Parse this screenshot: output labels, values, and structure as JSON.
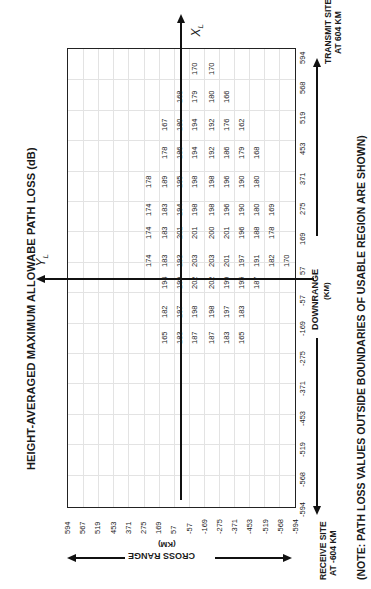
{
  "chart_data": {
    "type": "table",
    "title": "HEIGHT-AVERAGED MAXIMUM ALLOWABE PATH LOSS (dB)",
    "note": "(NOTE:  PATH LOSS VALUES OUTSIDE BOUNDARIES OF USABLE REGION  ARE SHOWN)",
    "xlabel": "DOWNRANGE (KM)",
    "ylabel": "CROSS RANGE (KM)",
    "x_axis_name": "X_L",
    "y_axis_name": "Y_L",
    "receive_site": "RECEIVE SITE AT -604 KM",
    "transmit_site": "TRANSMIT SITE AT 604 KM",
    "downrange_ticks": [
      -594,
      -568,
      -519,
      -453,
      -371,
      -275,
      -169,
      -57,
      57,
      169,
      275,
      371,
      453,
      519,
      568,
      594
    ],
    "crossrange_ticks": [
      594,
      567,
      519,
      453,
      371,
      275,
      169,
      57,
      -57,
      -169,
      -275,
      -371,
      -453,
      -519,
      -568,
      -594
    ],
    "grid": true,
    "columns_note": "columns ordered left-to-right on the page (cross range decreasing)",
    "rows": [
      {
        "downrange_label": "568",
        "values": [
          null,
          null,
          null,
          null,
          "170",
          "170"
        ]
      },
      {
        "downrange_label": "519",
        "values": [
          null,
          null,
          null,
          "168",
          "179",
          "180",
          "166"
        ]
      },
      {
        "downrange_label": "453",
        "values": [
          null,
          null,
          "167",
          "180",
          "194",
          "192",
          "176",
          "162"
        ]
      },
      {
        "downrange_label": "371",
        "values": [
          null,
          "178",
          "186",
          "194",
          "192",
          "186",
          "179",
          "168"
        ]
      },
      {
        "downrange_label": "275",
        "values": [
          "178",
          "189",
          "195",
          "198",
          "198",
          "196",
          "190",
          "180",
          "169"
        ]
      },
      {
        "downrange_label": "169",
        "values": [
          "174",
          "183",
          "194",
          "198",
          "201",
          "200",
          "201",
          "196",
          "188",
          "178"
        ]
      },
      {
        "downrange_label": "57",
        "values": [
          "174",
          "183",
          "193",
          "201",
          "203",
          "203",
          "201",
          "197",
          "191",
          "182",
          "170"
        ]
      },
      {
        "downrange_label": "-57",
        "values": [
          "174",
          "194",
          "199",
          "202",
          "202",
          "199",
          "195",
          "187"
        ]
      },
      {
        "downrange_label": "-169",
        "values": [
          "182",
          "197",
          "198",
          "198",
          "197",
          "183"
        ]
      },
      {
        "downrange_label": "-275",
        "values": [
          "165",
          "183",
          "187",
          "187",
          "183",
          "165"
        ]
      }
    ]
  },
  "labels": {
    "title": "HEIGHT-AVERAGED MAXIMUM ALLOWABE PATH LOSS (dB)",
    "note": "(NOTE:  PATH LOSS VALUES OUTSIDE BOUNDARIES OF USABLE REGION  ARE SHOWN)",
    "downrange": "DOWNRANGE",
    "downrange_unit": "(KM)",
    "crossrange": "CROSS RANGE",
    "crossrange_unit": "(KM)",
    "x_axis": "X",
    "x_axis_sub": "L",
    "y_axis": "Y",
    "y_axis_sub": "L",
    "receive_line1": "RECEIVE SITE",
    "receive_line2": "AT -604 KM",
    "transmit_line1": "TRANSMIT SITE",
    "transmit_line2": "AT 604 KM"
  },
  "ticks": {
    "down": [
      "594",
      "568",
      "519",
      "453",
      "371",
      "275",
      "169",
      "57",
      "-57",
      "-169",
      "-275",
      "-371",
      "-453",
      "-519",
      "-568",
      "-594"
    ],
    "cross": [
      "594",
      "567",
      "519",
      "453",
      "371",
      "275",
      "169",
      "57",
      "-57",
      "-169",
      "-275",
      "-371",
      "-453",
      "-519",
      "-568",
      "-594"
    ]
  },
  "cells": [
    {
      "x": 144,
      "y": 267,
      "v": "174"
    },
    {
      "x": 144,
      "y": 239,
      "v": "174"
    },
    {
      "x": 144,
      "y": 216,
      "v": "174"
    },
    {
      "x": 144,
      "y": 188,
      "v": "178"
    },
    {
      "x": 160,
      "y": 344,
      "v": "165"
    },
    {
      "x": 160,
      "y": 318,
      "v": "182"
    },
    {
      "x": 160,
      "y": 289,
      "v": "194"
    },
    {
      "x": 160,
      "y": 267,
      "v": "183"
    },
    {
      "x": 160,
      "y": 239,
      "v": "183"
    },
    {
      "x": 160,
      "y": 216,
      "v": "183"
    },
    {
      "x": 160,
      "y": 188,
      "v": "189"
    },
    {
      "x": 160,
      "y": 159,
      "v": "178"
    },
    {
      "x": 160,
      "y": 131,
      "v": "167"
    },
    {
      "x": 175,
      "y": 344,
      "v": "183"
    },
    {
      "x": 175,
      "y": 318,
      "v": "197"
    },
    {
      "x": 175,
      "y": 289,
      "v": "199"
    },
    {
      "x": 175,
      "y": 267,
      "v": "193"
    },
    {
      "x": 175,
      "y": 239,
      "v": "201"
    },
    {
      "x": 175,
      "y": 216,
      "v": "194"
    },
    {
      "x": 175,
      "y": 188,
      "v": "195"
    },
    {
      "x": 175,
      "y": 159,
      "v": "186"
    },
    {
      "x": 175,
      "y": 131,
      "v": "180"
    },
    {
      "x": 175,
      "y": 103,
      "v": "168"
    },
    {
      "x": 190,
      "y": 344,
      "v": "187"
    },
    {
      "x": 190,
      "y": 318,
      "v": "198"
    },
    {
      "x": 190,
      "y": 289,
      "v": "202"
    },
    {
      "x": 190,
      "y": 267,
      "v": "203"
    },
    {
      "x": 190,
      "y": 239,
      "v": "201"
    },
    {
      "x": 190,
      "y": 216,
      "v": "198"
    },
    {
      "x": 190,
      "y": 188,
      "v": "198"
    },
    {
      "x": 190,
      "y": 159,
      "v": "194"
    },
    {
      "x": 190,
      "y": 131,
      "v": "194"
    },
    {
      "x": 190,
      "y": 103,
      "v": "179"
    },
    {
      "x": 190,
      "y": 75,
      "v": "170"
    },
    {
      "x": 207,
      "y": 344,
      "v": "187"
    },
    {
      "x": 207,
      "y": 318,
      "v": "198"
    },
    {
      "x": 207,
      "y": 289,
      "v": "202"
    },
    {
      "x": 207,
      "y": 267,
      "v": "203"
    },
    {
      "x": 207,
      "y": 239,
      "v": "200"
    },
    {
      "x": 207,
      "y": 216,
      "v": "198"
    },
    {
      "x": 207,
      "y": 188,
      "v": "198"
    },
    {
      "x": 207,
      "y": 159,
      "v": "192"
    },
    {
      "x": 207,
      "y": 131,
      "v": "192"
    },
    {
      "x": 207,
      "y": 103,
      "v": "180"
    },
    {
      "x": 207,
      "y": 75,
      "v": "170"
    },
    {
      "x": 222,
      "y": 344,
      "v": "183"
    },
    {
      "x": 222,
      "y": 318,
      "v": "197"
    },
    {
      "x": 222,
      "y": 289,
      "v": "199"
    },
    {
      "x": 222,
      "y": 267,
      "v": "201"
    },
    {
      "x": 222,
      "y": 239,
      "v": "201"
    },
    {
      "x": 222,
      "y": 216,
      "v": "196"
    },
    {
      "x": 222,
      "y": 188,
      "v": "196"
    },
    {
      "x": 222,
      "y": 159,
      "v": "186"
    },
    {
      "x": 222,
      "y": 131,
      "v": "176"
    },
    {
      "x": 222,
      "y": 103,
      "v": "166"
    },
    {
      "x": 237,
      "y": 344,
      "v": "165"
    },
    {
      "x": 237,
      "y": 318,
      "v": "183"
    },
    {
      "x": 237,
      "y": 289,
      "v": "195"
    },
    {
      "x": 237,
      "y": 267,
      "v": "197"
    },
    {
      "x": 237,
      "y": 239,
      "v": "196"
    },
    {
      "x": 237,
      "y": 216,
      "v": "190"
    },
    {
      "x": 237,
      "y": 188,
      "v": "190"
    },
    {
      "x": 237,
      "y": 159,
      "v": "179"
    },
    {
      "x": 237,
      "y": 131,
      "v": "162"
    },
    {
      "x": 252,
      "y": 289,
      "v": "187"
    },
    {
      "x": 252,
      "y": 267,
      "v": "191"
    },
    {
      "x": 252,
      "y": 239,
      "v": "188"
    },
    {
      "x": 252,
      "y": 216,
      "v": "180"
    },
    {
      "x": 252,
      "y": 188,
      "v": "180"
    },
    {
      "x": 252,
      "y": 159,
      "v": "168"
    },
    {
      "x": 267,
      "y": 267,
      "v": "182"
    },
    {
      "x": 267,
      "y": 239,
      "v": "178"
    },
    {
      "x": 267,
      "y": 216,
      "v": "169"
    },
    {
      "x": 282,
      "y": 267,
      "v": "170"
    }
  ]
}
